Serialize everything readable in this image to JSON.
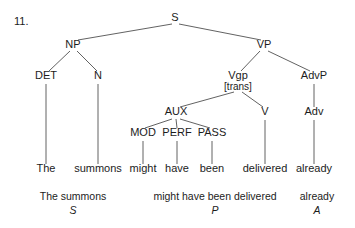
{
  "figure": {
    "number_label": "11.",
    "type": "syntax-tree",
    "sentence": "The summons might have been delivered already"
  },
  "nodes": {
    "s": {
      "label": "S",
      "x": 175,
      "y": 21
    },
    "np": {
      "label": "NP",
      "x": 73,
      "y": 48
    },
    "vp": {
      "label": "VP",
      "x": 264,
      "y": 48
    },
    "det": {
      "label": "DET",
      "x": 46,
      "y": 79
    },
    "n": {
      "label": "N",
      "x": 98,
      "y": 79
    },
    "vgp": {
      "label": "Vgp",
      "feature": "[trans]",
      "x": 238,
      "y": 79
    },
    "advp": {
      "label": "AdvP",
      "x": 314,
      "y": 79
    },
    "aux": {
      "label": "AUX",
      "x": 176,
      "y": 115
    },
    "v": {
      "label": "V",
      "x": 265,
      "y": 115
    },
    "adv": {
      "label": "Adv",
      "x": 314,
      "y": 115
    },
    "mod": {
      "label": "MOD",
      "x": 143,
      "y": 136
    },
    "perf": {
      "label": "PERF",
      "x": 177,
      "y": 136
    },
    "pass": {
      "label": "PASS",
      "x": 212,
      "y": 136
    }
  },
  "terminals": [
    {
      "word": "The",
      "x": 46,
      "y": 172
    },
    {
      "word": "summons",
      "x": 98,
      "y": 172
    },
    {
      "word": "might",
      "x": 143,
      "y": 172
    },
    {
      "word": "have",
      "x": 177,
      "y": 172
    },
    {
      "word": "been",
      "x": 212,
      "y": 172
    },
    {
      "word": "delivered",
      "x": 265,
      "y": 172
    },
    {
      "word": "already",
      "x": 314,
      "y": 172
    }
  ],
  "analysis_row": [
    {
      "words": "The summons",
      "function": "S",
      "x": 73,
      "word_y": 200,
      "func_y": 214
    },
    {
      "words": "might have been delivered",
      "function": "P",
      "x": 215,
      "word_y": 200,
      "func_y": 214
    },
    {
      "words": "already",
      "function": "A",
      "x": 317,
      "word_y": 200,
      "func_y": 214
    }
  ],
  "colors": {
    "background": "#ffffff",
    "text": "#1c1c1c",
    "branch": "#3a3a3a"
  }
}
